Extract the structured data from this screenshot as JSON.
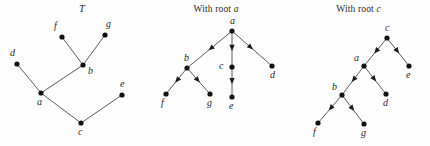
{
  "figure": {
    "width": 430,
    "height": 146,
    "background": "#fdfdfd",
    "ink_color": "#1f1f1f",
    "edge_color": "#4a4a4a"
  },
  "panels": [
    {
      "id": "tree-t",
      "title": "T",
      "title_style": "italic",
      "directed": false,
      "origin_x": 0,
      "nodes": [
        {
          "id": "f",
          "label": "f",
          "x": 62,
          "y": 37,
          "label_dx": -8,
          "label_dy": -16
        },
        {
          "id": "g",
          "label": "g",
          "x": 105,
          "y": 35,
          "label_dx": 1,
          "label_dy": -16
        },
        {
          "id": "d",
          "label": "d",
          "x": 17,
          "y": 64,
          "label_dx": -7,
          "label_dy": -16
        },
        {
          "id": "b",
          "label": "b",
          "x": 83,
          "y": 65,
          "label_dx": 5,
          "label_dy": 1
        },
        {
          "id": "a",
          "label": "a",
          "x": 41,
          "y": 93,
          "label_dx": -4,
          "label_dy": 4
        },
        {
          "id": "e",
          "label": "e",
          "x": 122,
          "y": 95,
          "label_dx": -2,
          "label_dy": -16
        },
        {
          "id": "c",
          "label": "c",
          "x": 81,
          "y": 123,
          "label_dx": -3,
          "label_dy": 4
        }
      ],
      "edges": [
        {
          "from": "f",
          "to": "b"
        },
        {
          "from": "g",
          "to": "b"
        },
        {
          "from": "d",
          "to": "a"
        },
        {
          "from": "b",
          "to": "a"
        },
        {
          "from": "a",
          "to": "c"
        },
        {
          "from": "c",
          "to": "e"
        }
      ]
    },
    {
      "id": "tree-a",
      "title": "With root a",
      "title_plain": "With root ",
      "title_italic": "a",
      "directed": true,
      "origin_x": 145,
      "nodes": [
        {
          "id": "a",
          "label": "a",
          "x": 87,
          "y": 31,
          "label_dx": -2,
          "label_dy": -15
        },
        {
          "id": "b",
          "label": "b",
          "x": 42,
          "y": 68,
          "label_dx": -3,
          "label_dy": -15
        },
        {
          "id": "c",
          "label": "c",
          "x": 87,
          "y": 67,
          "label_dx": -13,
          "label_dy": -6
        },
        {
          "id": "d",
          "label": "d",
          "x": 127,
          "y": 66,
          "label_dx": -2,
          "label_dy": 4
        },
        {
          "id": "f",
          "label": "f",
          "x": 21,
          "y": 94,
          "label_dx": -5,
          "label_dy": 4
        },
        {
          "id": "g",
          "label": "g",
          "x": 65,
          "y": 94,
          "label_dx": -3,
          "label_dy": 4
        },
        {
          "id": "e",
          "label": "e",
          "x": 87,
          "y": 97,
          "label_dx": -3,
          "label_dy": 4
        }
      ],
      "edges": [
        {
          "from": "a",
          "to": "b"
        },
        {
          "from": "a",
          "to": "c"
        },
        {
          "from": "a",
          "to": "d"
        },
        {
          "from": "b",
          "to": "f"
        },
        {
          "from": "b",
          "to": "g"
        },
        {
          "from": "c",
          "to": "e"
        }
      ]
    },
    {
      "id": "tree-c",
      "title": "With root c",
      "title_plain": "With root ",
      "title_italic": "c",
      "directed": true,
      "origin_x": 287,
      "nodes": [
        {
          "id": "c",
          "label": "c",
          "x": 100,
          "y": 38,
          "label_dx": -2,
          "label_dy": -15
        },
        {
          "id": "a",
          "label": "a",
          "x": 77,
          "y": 66,
          "label_dx": -10,
          "label_dy": -13
        },
        {
          "id": "e",
          "label": "e",
          "x": 122,
          "y": 66,
          "label_dx": -3,
          "label_dy": 4
        },
        {
          "id": "b",
          "label": "b",
          "x": 55,
          "y": 95,
          "label_dx": -10,
          "label_dy": -13
        },
        {
          "id": "d",
          "label": "d",
          "x": 99,
          "y": 94,
          "label_dx": -3,
          "label_dy": 4
        },
        {
          "id": "f",
          "label": "f",
          "x": 31,
          "y": 123,
          "label_dx": -5,
          "label_dy": 4
        },
        {
          "id": "g",
          "label": "g",
          "x": 77,
          "y": 124,
          "label_dx": -3,
          "label_dy": 4
        }
      ],
      "edges": [
        {
          "from": "c",
          "to": "a"
        },
        {
          "from": "c",
          "to": "e"
        },
        {
          "from": "a",
          "to": "b"
        },
        {
          "from": "a",
          "to": "d"
        },
        {
          "from": "b",
          "to": "f"
        },
        {
          "from": "b",
          "to": "g"
        }
      ]
    }
  ]
}
